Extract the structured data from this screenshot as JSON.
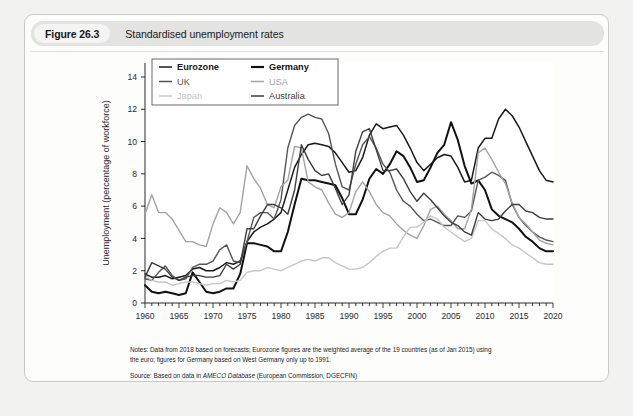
{
  "figure": {
    "badge": "Figure 26.3",
    "title": "Standardised unemployment rates"
  },
  "notes": {
    "line1": "Notes: Data from 2018 based on forecasts; Eurozone figures are the weighted average of the 19 countries (as of Jan 2015) using",
    "line2": "the euro; figures for Germany based on West Germany only up to 1991.",
    "source_prefix": "Source: Based on data in ",
    "source_italic": "AMECO Database",
    "source_suffix": " (European Commission, DGECFIN)"
  },
  "chart_data": {
    "type": "line",
    "title": "Standardised unemployment rates",
    "xlabel": "",
    "ylabel": "Unemployment (percentage of workforce)",
    "xlim": [
      1960,
      2020
    ],
    "ylim": [
      0,
      14
    ],
    "ytick_step": 2,
    "yticks": [
      0,
      2,
      4,
      6,
      8,
      10,
      12,
      14
    ],
    "xticks": [
      1960,
      1965,
      1970,
      1975,
      1980,
      1985,
      1990,
      1995,
      2000,
      2005,
      2010,
      2015,
      2020
    ],
    "xminor_step": 1,
    "grid": false,
    "legend_position": "top-left-inside",
    "legend_columns": 2,
    "x": [
      1960,
      1961,
      1962,
      1963,
      1964,
      1965,
      1966,
      1967,
      1968,
      1969,
      1970,
      1971,
      1972,
      1973,
      1974,
      1975,
      1976,
      1977,
      1978,
      1979,
      1980,
      1981,
      1982,
      1983,
      1984,
      1985,
      1986,
      1987,
      1988,
      1989,
      1990,
      1991,
      1992,
      1993,
      1994,
      1995,
      1996,
      1997,
      1998,
      1999,
      2000,
      2001,
      2002,
      2003,
      2004,
      2005,
      2006,
      2007,
      2008,
      2009,
      2010,
      2011,
      2012,
      2013,
      2014,
      2015,
      2016,
      2017,
      2018,
      2019,
      2020
    ],
    "series": [
      {
        "name": "Eurozone",
        "color": "#1a1a1a",
        "width": 1.5,
        "values": [
          1.8,
          1.6,
          1.6,
          1.7,
          1.5,
          1.6,
          1.7,
          2.1,
          2.2,
          2.0,
          2.0,
          2.2,
          2.5,
          2.4,
          2.6,
          3.8,
          4.4,
          4.7,
          4.9,
          5.2,
          5.6,
          7.0,
          8.4,
          9.2,
          9.8,
          9.9,
          9.8,
          9.7,
          9.3,
          8.7,
          8.1,
          8.2,
          9.0,
          10.4,
          11.1,
          10.8,
          10.9,
          11.0,
          10.4,
          9.6,
          8.7,
          8.2,
          8.6,
          9.0,
          9.2,
          9.1,
          8.4,
          7.5,
          7.6,
          9.6,
          10.2,
          10.2,
          11.4,
          12.0,
          11.6,
          10.9,
          10.0,
          9.1,
          8.2,
          7.6,
          7.5
        ]
      },
      {
        "name": "Germany",
        "color": "#111111",
        "width": 2.0,
        "values": [
          1.1,
          0.7,
          0.6,
          0.7,
          0.6,
          0.5,
          0.6,
          1.9,
          1.3,
          0.7,
          0.6,
          0.7,
          0.9,
          0.9,
          1.8,
          3.7,
          3.7,
          3.6,
          3.5,
          3.2,
          3.2,
          4.4,
          6.1,
          7.7,
          7.6,
          7.6,
          7.5,
          7.4,
          7.3,
          6.5,
          5.5,
          5.5,
          6.4,
          7.7,
          8.3,
          8.0,
          8.6,
          9.4,
          9.1,
          8.4,
          7.5,
          7.6,
          8.4,
          9.3,
          9.8,
          11.2,
          10.1,
          8.5,
          7.4,
          7.6,
          7.0,
          5.8,
          5.4,
          5.2,
          5.0,
          4.6,
          4.1,
          3.8,
          3.4,
          3.2,
          3.2
        ]
      },
      {
        "name": "UK",
        "color": "#555555",
        "width": 1.4,
        "values": [
          1.5,
          1.4,
          1.9,
          2.3,
          1.7,
          1.4,
          1.5,
          2.2,
          2.4,
          2.4,
          2.6,
          3.3,
          3.6,
          2.6,
          2.5,
          3.8,
          5.3,
          5.6,
          5.6,
          5.2,
          6.4,
          9.6,
          11.0,
          11.5,
          11.7,
          11.5,
          11.4,
          10.5,
          8.6,
          7.2,
          7.0,
          8.6,
          9.8,
          10.3,
          9.6,
          8.6,
          8.1,
          7.0,
          6.3,
          6.0,
          5.5,
          5.1,
          5.2,
          5.0,
          4.8,
          4.8,
          5.4,
          5.3,
          5.7,
          7.6,
          7.8,
          8.1,
          7.9,
          7.6,
          6.1,
          5.3,
          4.8,
          4.4,
          4.1,
          3.9,
          3.8
        ]
      },
      {
        "name": "USA",
        "color": "#a3a3a3",
        "width": 1.4,
        "values": [
          5.5,
          6.7,
          5.6,
          5.6,
          5.2,
          4.5,
          3.8,
          3.8,
          3.6,
          3.5,
          4.9,
          5.9,
          5.6,
          4.9,
          5.6,
          8.5,
          7.7,
          7.1,
          6.1,
          5.9,
          7.2,
          7.6,
          9.7,
          9.6,
          7.5,
          7.2,
          7.0,
          6.2,
          5.5,
          5.3,
          5.6,
          6.9,
          7.5,
          6.9,
          6.1,
          5.6,
          5.4,
          4.9,
          4.5,
          4.2,
          4.0,
          4.8,
          5.8,
          6.0,
          5.5,
          5.1,
          4.6,
          4.6,
          5.8,
          9.3,
          9.6,
          8.9,
          8.1,
          7.4,
          6.2,
          5.3,
          4.9,
          4.4,
          3.9,
          3.7,
          3.6
        ]
      },
      {
        "name": "Japan",
        "color": "#c6c6c6",
        "width": 1.4,
        "values": [
          1.7,
          1.4,
          1.3,
          1.3,
          1.1,
          1.2,
          1.3,
          1.3,
          1.2,
          1.1,
          1.2,
          1.2,
          1.4,
          1.3,
          1.4,
          1.9,
          2.0,
          2.0,
          2.2,
          2.1,
          2.0,
          2.2,
          2.4,
          2.6,
          2.7,
          2.6,
          2.8,
          2.8,
          2.5,
          2.3,
          2.1,
          2.1,
          2.2,
          2.5,
          2.9,
          3.2,
          3.4,
          3.4,
          4.1,
          4.7,
          4.7,
          5.0,
          5.4,
          5.2,
          4.7,
          4.4,
          4.1,
          3.8,
          4.0,
          5.1,
          5.1,
          4.6,
          4.3,
          4.0,
          3.6,
          3.4,
          3.1,
          2.8,
          2.5,
          2.4,
          2.4
        ]
      },
      {
        "name": "Australia",
        "color": "#3d3d3d",
        "width": 1.4,
        "values": [
          1.6,
          2.5,
          2.3,
          2.1,
          1.6,
          1.4,
          1.6,
          1.7,
          1.7,
          1.6,
          1.6,
          1.7,
          2.4,
          2.1,
          2.4,
          4.6,
          4.6,
          5.4,
          6.1,
          6.1,
          5.9,
          5.5,
          7.0,
          9.8,
          8.9,
          8.2,
          7.9,
          8.0,
          7.1,
          6.1,
          6.7,
          9.4,
          10.6,
          10.8,
          9.5,
          8.2,
          8.2,
          8.3,
          7.7,
          6.9,
          6.3,
          6.8,
          6.4,
          5.9,
          5.4,
          5.0,
          4.8,
          4.4,
          4.2,
          5.6,
          5.2,
          5.1,
          5.2,
          5.7,
          6.1,
          6.1,
          5.7,
          5.6,
          5.3,
          5.2,
          5.2
        ]
      }
    ]
  },
  "legend": {
    "items": [
      {
        "label": "Eurozone",
        "color": "#1a1a1a",
        "width": 1.5
      },
      {
        "label": "Germany",
        "color": "#111111",
        "width": 2.2
      },
      {
        "label": "UK",
        "color": "#555555",
        "width": 1.5
      },
      {
        "label": "USA",
        "color": "#a3a3a3",
        "width": 1.5
      },
      {
        "label": "Japan",
        "color": "#c6c6c6",
        "width": 1.5
      },
      {
        "label": "Australia",
        "color": "#3d3d3d",
        "width": 1.5
      }
    ]
  }
}
